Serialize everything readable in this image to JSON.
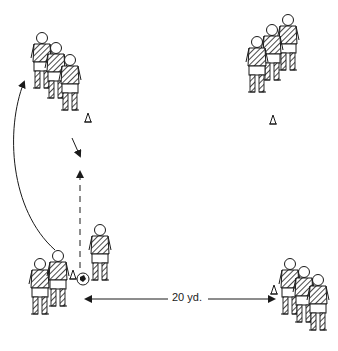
{
  "diagram": {
    "distance_label": "20 yd.",
    "colors": {
      "ink": "#1a1a1a",
      "background": "#ffffff"
    },
    "groups": [
      {
        "id": "top-left",
        "players": 3,
        "cone": true
      },
      {
        "id": "top-right",
        "players": 3,
        "cone": true
      },
      {
        "id": "bottom-left",
        "players": 2,
        "cone": true,
        "dribbler_with_ball": true
      },
      {
        "id": "bottom-right",
        "players": 3,
        "cone": true
      }
    ],
    "arrows": [
      {
        "type": "curved",
        "from": "bottom-left",
        "to": "top-left"
      },
      {
        "type": "dashed",
        "from": "bottom-left",
        "to": "top-left",
        "meaning": "pass"
      },
      {
        "type": "solid",
        "from": "top-left",
        "to": "pass-target"
      },
      {
        "type": "double",
        "between": [
          "bottom-left",
          "bottom-right"
        ],
        "label": "20 yd."
      }
    ]
  }
}
